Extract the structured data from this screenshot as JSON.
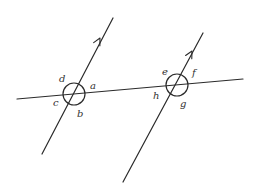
{
  "diagram": {
    "line_color": "#2a2a2a",
    "label_color": "#333333",
    "transversal": {
      "x1": 17,
      "y1": 99,
      "x2": 243,
      "y2": 79
    },
    "parallel_lines": [
      {
        "id": "line-1",
        "x1": 42,
        "y1": 154,
        "x2": 113,
        "y2": 18,
        "arrow_at": [
          100,
          38
        ],
        "has_arrow": true
      },
      {
        "id": "line-2",
        "x1": 123,
        "y1": 182,
        "x2": 203,
        "y2": 33,
        "arrow_at": [
          192,
          51
        ],
        "has_arrow": true
      }
    ],
    "intersections": [
      {
        "id": "left",
        "cx": 74,
        "cy": 94,
        "r": 11,
        "angles": [
          {
            "label": "d",
            "x": 59,
            "y": 82
          },
          {
            "label": "a",
            "x": 90,
            "y": 89
          },
          {
            "label": "c",
            "x": 53,
            "y": 106
          },
          {
            "label": "b",
            "x": 77,
            "y": 117
          }
        ]
      },
      {
        "id": "right",
        "cx": 177,
        "cy": 85,
        "r": 11,
        "angles": [
          {
            "label": "e",
            "x": 162,
            "y": 75
          },
          {
            "label": "f",
            "x": 192,
            "y": 76
          },
          {
            "label": "h",
            "x": 153,
            "y": 99
          },
          {
            "label": "g",
            "x": 180,
            "y": 107
          }
        ]
      }
    ]
  }
}
